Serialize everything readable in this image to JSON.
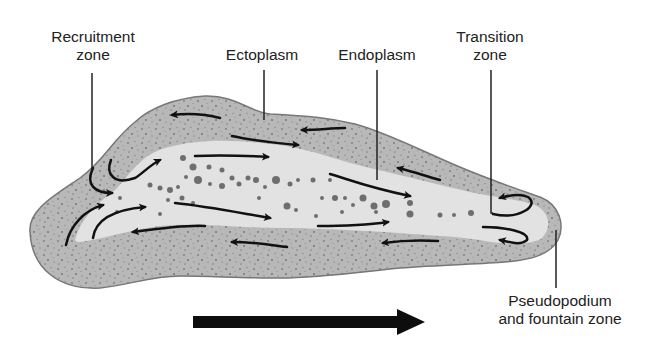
{
  "diagram": {
    "labels": {
      "recruitment_zone": {
        "line1": "Recruitment",
        "line2": "zone"
      },
      "ectoplasm": {
        "line1": "Ectoplasm"
      },
      "endoplasm": {
        "line1": "Endoplasm"
      },
      "transition_zone": {
        "line1": "Transition",
        "line2": "zone"
      },
      "pseudopodium": {
        "line1": "Pseudopodium",
        "line2": "and fountain zone"
      }
    },
    "direction_arrow": "direction-of-movement-right",
    "colors": {
      "background": "#ffffff",
      "ectoplasm": "#b8b8b8",
      "endoplasm": "#e2e2e2",
      "outline": "#777777",
      "granules": "#6e6e6e",
      "arrows": "#111111",
      "text": "#222222"
    }
  }
}
